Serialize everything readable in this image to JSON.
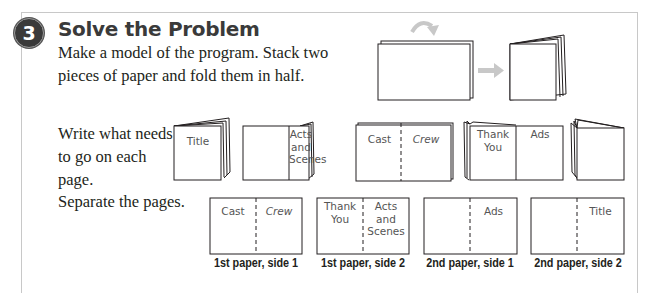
{
  "step": {
    "number": "3",
    "title": "Solve the Problem"
  },
  "instructions": {
    "intro": "Make a model of the program. Stack two pieces of paper and fold them in half.",
    "write": "Write what needs to go on each page.",
    "separate": "Separate the pages."
  },
  "booklet_pages": {
    "title_page": "Title",
    "acts_page": [
      "Acts",
      "and",
      "Scenes"
    ],
    "cast_page": "Cast",
    "crew_page": "Crew",
    "thank_you_page": [
      "Thank",
      "You"
    ],
    "ads_page": "Ads"
  },
  "separated_sheets": [
    {
      "left": [
        "Cast"
      ],
      "right": [
        "Crew"
      ],
      "caption": "1st paper, side 1"
    },
    {
      "left": [
        "Thank",
        "You"
      ],
      "right": [
        "Acts",
        "and",
        "Scenes"
      ],
      "caption": "1st paper, side 2"
    },
    {
      "left": [],
      "right": [
        "Ads"
      ],
      "caption": "2nd paper, side 1"
    },
    {
      "left": [],
      "right": [
        "Title"
      ],
      "caption": "2nd paper, side 2"
    }
  ],
  "colors": {
    "badge": "#3a3a3a",
    "title": "#3a3a3a",
    "panel_border": "#c8c8c8",
    "arrow": "#c8c8c8",
    "line": "#231f20"
  }
}
